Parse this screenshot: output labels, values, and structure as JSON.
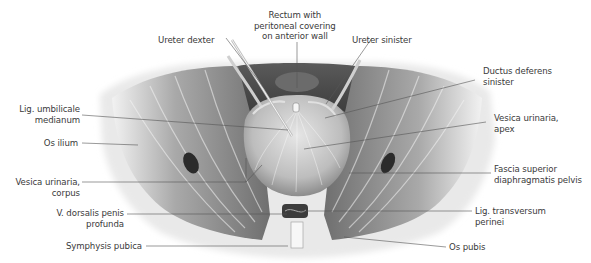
{
  "figure": {
    "colors": {
      "text": "#3a3a3a",
      "leader_line": "#555555",
      "tissue_dark": "#4a4a4a",
      "tissue_mid": "#8a8a8a",
      "tissue_light": "#d8d8d8",
      "bone": "#eeeeee"
    }
  },
  "labels": {
    "rectum": {
      "line1": "Rectum with",
      "line2": "peritoneal covering",
      "line3": "on anterior wall"
    },
    "ureter_dexter": {
      "line1": "Ureter dexter"
    },
    "ureter_sinister": {
      "line1": "Ureter sinister"
    },
    "ductus_deferens": {
      "line1": "Ductus deferens",
      "line2": "sinister"
    },
    "lig_umbilicale": {
      "line1": "Lig. umbilicale",
      "line2": "medianum"
    },
    "vesica_apex": {
      "line1": "Vesica urinaria,",
      "line2": "apex"
    },
    "os_ilium": {
      "line1": "Os ilium"
    },
    "fascia": {
      "line1": "Fascia superior",
      "line2": "diaphragmatis pelvis"
    },
    "vesica_corpus": {
      "line1": "Vesica urinaria,",
      "line2": "corpus"
    },
    "v_dorsalis": {
      "line1": "V. dorsalis penis",
      "line2": "profunda"
    },
    "lig_transversum": {
      "line1": "Lig. transversum",
      "line2": "perinei"
    },
    "symphysis": {
      "line1": "Symphysis pubica"
    },
    "os_pubis": {
      "line1": "Os pubis"
    }
  }
}
